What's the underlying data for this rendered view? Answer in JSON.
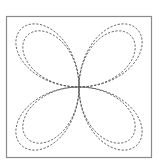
{
  "figure": {
    "curves": [
      {
        "name": "outer-rose",
        "equation": "r = a*sin(2θ)",
        "petals": 4,
        "relative_size": 1.0,
        "style": "dashed"
      },
      {
        "name": "inner-rose",
        "equation": "r = a*sin(2θ)",
        "petals": 4,
        "relative_size": 0.89,
        "style": "dashed"
      }
    ],
    "colors": {
      "frame": "#8a8a8a",
      "curve": "#555555",
      "background": "#ffffff"
    }
  }
}
